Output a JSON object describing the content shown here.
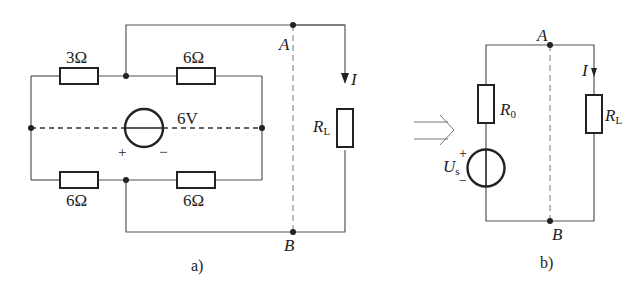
{
  "figure_a": {
    "caption": "a)",
    "resistors": [
      {
        "id": "r_top_left",
        "label": "3Ω"
      },
      {
        "id": "r_top_right",
        "label": "6Ω"
      },
      {
        "id": "r_bottom_left",
        "label": "6Ω"
      },
      {
        "id": "r_bottom_right",
        "label": "6Ω"
      }
    ],
    "source": {
      "label": "6V",
      "plus": "+",
      "minus": "−"
    },
    "node_a": "A",
    "node_b": "B",
    "load": {
      "label": "R",
      "sub": "L"
    },
    "current": "I"
  },
  "figure_b": {
    "caption": "b)",
    "r0": {
      "label": "R",
      "sub": "0"
    },
    "source": {
      "label": "U",
      "sub": "s",
      "plus": "+",
      "minus": "−"
    },
    "node_a": "A",
    "node_b": "B",
    "load": {
      "label": "R",
      "sub": "L"
    },
    "current": "I"
  },
  "arrow": "equivalent-arrow"
}
